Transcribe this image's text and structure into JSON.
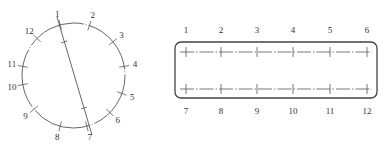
{
  "colors": {
    "stroke": "#555555",
    "label": "#333333",
    "background": "#ffffff"
  },
  "circle_diagram": {
    "center": [
      73.5,
      75.5
    ],
    "rx": 51.5,
    "ry": 52.5,
    "diameter_line": {
      "from_label": "1",
      "to_label": "7"
    },
    "points": [
      {
        "label": "1",
        "angle": -105
      },
      {
        "label": "2",
        "angle": -72
      },
      {
        "label": "3",
        "angle": -40
      },
      {
        "label": "4",
        "angle": -10
      },
      {
        "label": "5",
        "angle": 20
      },
      {
        "label": "6",
        "angle": 45
      },
      {
        "label": "7",
        "angle": 75
      },
      {
        "label": "8",
        "angle": 105
      },
      {
        "label": "9",
        "angle": 140
      },
      {
        "label": "10",
        "angle": 170
      },
      {
        "label": "11",
        "angle": -170
      },
      {
        "label": "12",
        "angle": -135
      }
    ]
  },
  "rect_diagram": {
    "top_labels": [
      "1",
      "2",
      "3",
      "4",
      "5",
      "6"
    ],
    "bottom_labels": [
      "7",
      "8",
      "9",
      "10",
      "11",
      "12"
    ],
    "tick_x": [
      186,
      221,
      257,
      293,
      330,
      367
    ]
  }
}
